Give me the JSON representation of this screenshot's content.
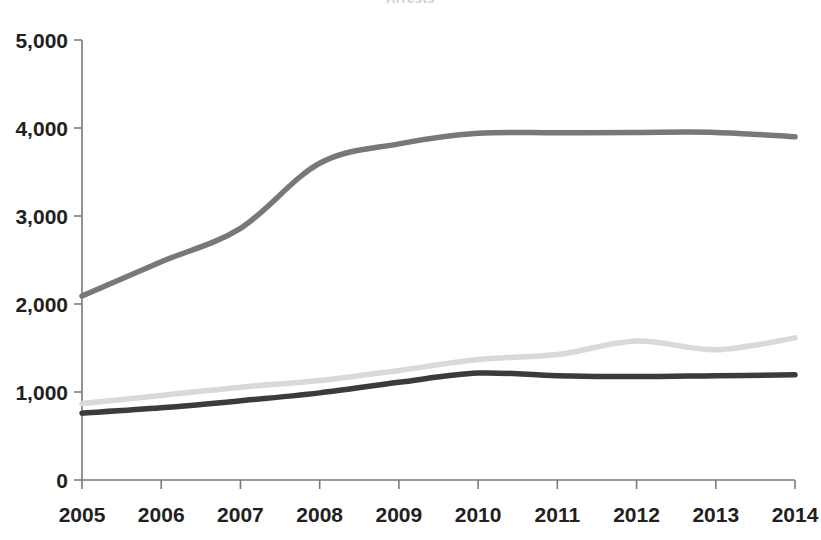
{
  "page": {
    "title_fragment": "Arrests",
    "background": "#ffffff"
  },
  "chart_data": {
    "type": "line",
    "title": "",
    "xlabel": "",
    "ylabel": "",
    "categories": [
      "2005",
      "2006",
      "2007",
      "2008",
      "2009",
      "2010",
      "2011",
      "2012",
      "2013",
      "2014"
    ],
    "x": [
      2005,
      2006,
      2007,
      2008,
      2009,
      2010,
      2011,
      2012,
      2013,
      2014
    ],
    "xlim": [
      2005,
      2014
    ],
    "ylim": [
      0,
      5000
    ],
    "yticks": [
      0,
      1000,
      2000,
      3000,
      4000,
      5000
    ],
    "ytick_labels": [
      "0",
      "1,000",
      "2,000",
      "3,000",
      "4,000",
      "5,000"
    ],
    "grid": false,
    "legend": "none",
    "series": [
      {
        "name": "series-1-medium-gray",
        "color": "#787878",
        "stroke_width": 5.5,
        "values": [
          2090,
          2480,
          2860,
          3600,
          3820,
          3940,
          3945,
          3950,
          3950,
          3900
        ]
      },
      {
        "name": "series-2-light-gray",
        "color": "#d9d9d9",
        "stroke_width": 5.5,
        "values": [
          870,
          960,
          1055,
          1130,
          1245,
          1370,
          1425,
          1580,
          1480,
          1615
        ]
      },
      {
        "name": "series-3-dark-gray",
        "color": "#3b3b3b",
        "stroke_width": 5.5,
        "values": [
          760,
          820,
          900,
          990,
          1110,
          1215,
          1185,
          1175,
          1185,
          1195
        ]
      }
    ]
  },
  "axes": {
    "y_axis_name": "value-axis",
    "x_axis_name": "year-axis"
  }
}
